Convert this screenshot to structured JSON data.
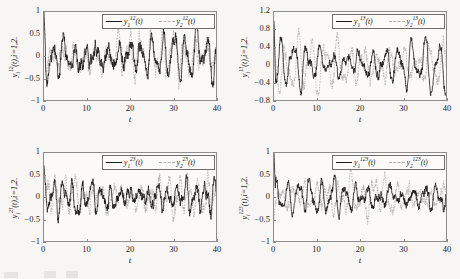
{
  "figure": {
    "background": "#f7f6f4",
    "series_colors": {
      "solid": "#1a1a1a",
      "dashed": "#b3b0ac"
    }
  },
  "chart_data": [
    {
      "type": "line",
      "panel": "top-left",
      "title": "",
      "xlabel": "t",
      "ylabel_plain": "y_i^12(t), i=1,2.",
      "ylabel_base": "y",
      "ylabel_sub": "i",
      "ylabel_sup": "12",
      "ylabel_tail": "(t),i=1,2.",
      "xlim": [
        0,
        40
      ],
      "ylim": [
        -1,
        1
      ],
      "xticks": [
        0,
        10,
        20,
        30,
        40
      ],
      "xticklabels": [
        "0",
        "10",
        "20",
        "30",
        "40"
      ],
      "yticks": [
        -1,
        -0.5,
        0,
        0.5,
        1
      ],
      "yticklabels": [
        "-1",
        "-0.5",
        "0",
        "0.5",
        "1"
      ],
      "grid": false,
      "legend_position": "upper-right",
      "seed": 11,
      "series": [
        {
          "name": "y1_12",
          "label_base": "y",
          "label_sub": "1",
          "label_sup": "12",
          "label_tail": "(t)",
          "style": "solid",
          "start_value": 1.0,
          "envelope": 0.3,
          "freq": 2.45,
          "noise": 0.1,
          "decay": 2.2
        },
        {
          "name": "y2_12",
          "label_base": "y",
          "label_sub": "2",
          "label_sup": "12",
          "label_tail": "(t)",
          "style": "dashed",
          "start_value": 0.0,
          "envelope": 0.3,
          "freq": 2.45,
          "noise": 0.12,
          "decay": 2.2
        }
      ]
    },
    {
      "type": "line",
      "panel": "top-right",
      "title": "",
      "xlabel": "t",
      "ylabel_plain": "y_i^13(t), i=1,2.",
      "ylabel_base": "y",
      "ylabel_sub": "i",
      "ylabel_sup": "13",
      "ylabel_tail": "(t),i=1,2.",
      "xlim": [
        0,
        40
      ],
      "ylim": [
        -0.8,
        1.2
      ],
      "xticks": [
        0,
        10,
        20,
        30,
        40
      ],
      "xticklabels": [
        "0",
        "10",
        "20",
        "30",
        "40"
      ],
      "yticks": [
        -0.8,
        -0.4,
        0,
        0.4,
        0.8,
        1.2
      ],
      "yticklabels": [
        "-0.8",
        "-0.4",
        "0",
        "0.4",
        "0.8",
        "1.2"
      ],
      "grid": false,
      "legend_position": "upper-right",
      "seed": 27,
      "series": [
        {
          "name": "y1_13",
          "label_base": "y",
          "label_sub": "1",
          "label_sup": "13",
          "label_tail": "(t)",
          "style": "solid",
          "start_value": 1.0,
          "envelope": 0.33,
          "freq": 2.05,
          "noise": 0.07,
          "decay": 2.4
        },
        {
          "name": "y2_13",
          "label_base": "y",
          "label_sub": "2",
          "label_sup": "13",
          "label_tail": "(t)",
          "style": "dashed",
          "start_value": 0.9,
          "envelope": 0.34,
          "freq": 2.05,
          "noise": 0.1,
          "decay": 2.4
        }
      ]
    },
    {
      "type": "line",
      "panel": "bottom-left",
      "title": "",
      "xlabel": "t",
      "ylabel_plain": "y_i^23(t), i=1,2.",
      "ylabel_base": "y",
      "ylabel_sub": "i",
      "ylabel_sup": "23",
      "ylabel_tail": "(t),i=1,2.",
      "xlim": [
        0,
        40
      ],
      "ylim": [
        -1,
        1
      ],
      "xticks": [
        0,
        10,
        20,
        30,
        40
      ],
      "xticklabels": [
        "0",
        "10",
        "20",
        "30",
        "40"
      ],
      "yticks": [
        -1,
        -0.5,
        0,
        0.5,
        1
      ],
      "yticklabels": [
        "-1",
        "-0.5",
        "0",
        "0.5",
        "1"
      ],
      "grid": false,
      "legend_position": "upper-right",
      "seed": 43,
      "series": [
        {
          "name": "y1_23",
          "label_base": "y",
          "label_sub": "1",
          "label_sup": "23",
          "label_tail": "(t)",
          "style": "solid",
          "start_value": 0.72,
          "envelope": 0.22,
          "freq": 2.85,
          "noise": 0.09,
          "decay": 2.0
        },
        {
          "name": "y2_23",
          "label_base": "y",
          "label_sub": "2",
          "label_sup": "23",
          "label_tail": "(t)",
          "style": "dashed",
          "start_value": -0.1,
          "envelope": 0.24,
          "freq": 2.85,
          "noise": 0.11,
          "decay": 2.0
        }
      ]
    },
    {
      "type": "line",
      "panel": "bottom-right",
      "title": "",
      "xlabel": "t",
      "ylabel_plain": "y_i^123(t), i=1,2.",
      "ylabel_base": "y",
      "ylabel_sub": "i",
      "ylabel_sup": "123",
      "ylabel_tail": "(t),i=1,2.",
      "xlim": [
        0,
        40
      ],
      "ylim": [
        -1,
        1
      ],
      "xticks": [
        0,
        10,
        20,
        30,
        40
      ],
      "xticklabels": [
        "0",
        "10",
        "20",
        "30",
        "40"
      ],
      "yticks": [
        -1,
        -0.5,
        0,
        0.5,
        1
      ],
      "yticklabels": [
        "-1",
        "-0.5",
        "0",
        "0.5",
        "1"
      ],
      "grid": false,
      "legend_position": "upper-right",
      "seed": 61,
      "series": [
        {
          "name": "y1_123",
          "label_base": "y",
          "label_sub": "1",
          "label_sup": "123",
          "label_tail": "(t)",
          "style": "solid",
          "start_value": 1.0,
          "envelope": 0.21,
          "freq": 2.35,
          "noise": 0.07,
          "decay": 2.6
        },
        {
          "name": "y2_123",
          "label_base": "y",
          "label_sub": "2",
          "label_sup": "123",
          "label_tail": "(t)",
          "style": "dashed",
          "start_value": -0.55,
          "envelope": 0.23,
          "freq": 2.35,
          "noise": 0.09,
          "decay": 2.6
        }
      ]
    }
  ]
}
